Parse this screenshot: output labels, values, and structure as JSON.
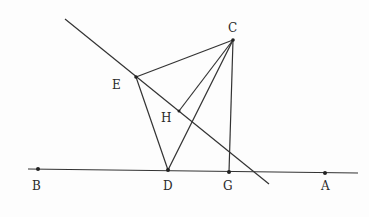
{
  "diagram": {
    "type": "geometry",
    "points": {
      "A": {
        "label": "A",
        "x": 325,
        "y": 173
      },
      "B": {
        "label": "B",
        "x": 38,
        "y": 169
      },
      "C": {
        "label": "C",
        "x": 233,
        "y": 40
      },
      "D": {
        "label": "D",
        "x": 168,
        "y": 170
      },
      "E": {
        "label": "E",
        "x": 136,
        "y": 77
      },
      "G": {
        "label": "G",
        "x": 229,
        "y": 172
      },
      "H": {
        "label": "H",
        "x": 179,
        "y": 111
      }
    },
    "segments": [
      [
        "C",
        "E"
      ],
      [
        "E",
        "D"
      ],
      [
        "C",
        "D"
      ],
      [
        "C",
        "H"
      ],
      [
        "C",
        "G"
      ],
      [
        "B",
        "A"
      ]
    ],
    "lines": [
      {
        "name": "oblique-line",
        "through": [
          "E",
          "H"
        ]
      }
    ]
  },
  "labels": {
    "A": "A",
    "B": "B",
    "C": "C",
    "D": "D",
    "E": "E",
    "G": "G",
    "H": "H"
  }
}
